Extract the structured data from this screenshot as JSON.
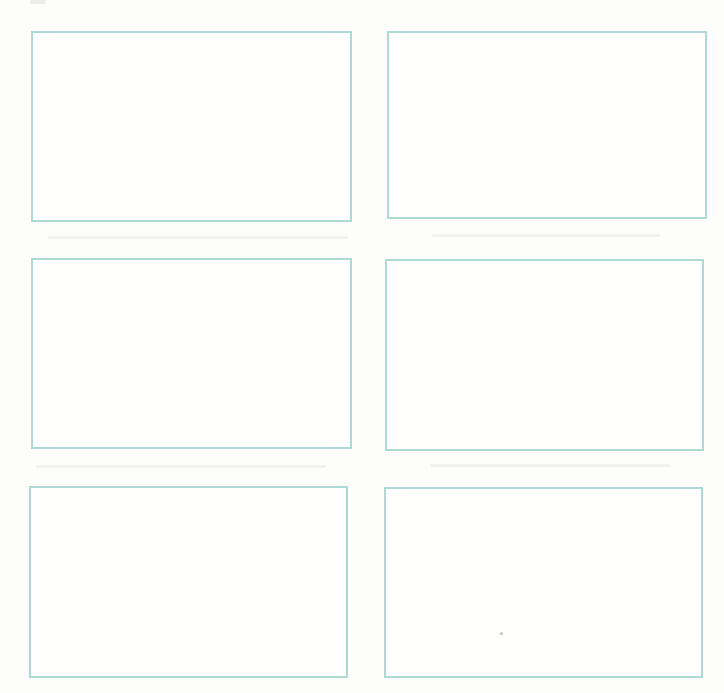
{
  "page": {
    "background": "#fdfdfc"
  },
  "colors": {
    "box_border": "#aedad4",
    "box_fill": "#fffffe",
    "page_background": "#fdfdfc"
  },
  "panels": [
    {
      "name": "answer-box-1",
      "row": 1,
      "column": 1,
      "content": ""
    },
    {
      "name": "answer-box-2",
      "row": 1,
      "column": 2,
      "content": ""
    },
    {
      "name": "answer-box-3",
      "row": 2,
      "column": 1,
      "content": ""
    },
    {
      "name": "answer-box-4",
      "row": 2,
      "column": 2,
      "content": ""
    },
    {
      "name": "answer-box-5",
      "row": 3,
      "column": 1,
      "content": ""
    },
    {
      "name": "answer-box-6",
      "row": 3,
      "column": 2,
      "content": ""
    }
  ],
  "artifacts": [
    {
      "name": "scan-smudge-top-left"
    },
    {
      "name": "scan-streak-row-gap-1-left"
    },
    {
      "name": "scan-streak-row-gap-1-right"
    },
    {
      "name": "scan-streak-row-gap-2-left"
    },
    {
      "name": "scan-streak-row-gap-2-right"
    },
    {
      "name": "scan-dot-bottom-right"
    }
  ]
}
